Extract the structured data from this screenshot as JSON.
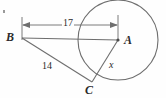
{
  "figure": {
    "type": "circle-tangent-geometry-diagram",
    "background_color": "#fefefe",
    "stroke_color": "#6e6e6e",
    "text_color": "#2b2b2b",
    "width": 166,
    "height": 98
  },
  "points": [
    {
      "name": "B",
      "label": "B",
      "x": 22,
      "y": 38,
      "label_x": 6,
      "label_y": 31
    },
    {
      "name": "A",
      "label": "A",
      "x": 118,
      "y": 40,
      "label_x": 124,
      "label_y": 34
    },
    {
      "name": "C",
      "label": "C",
      "x": 92,
      "y": 82,
      "label_x": 85,
      "label_y": 84
    }
  ],
  "circle": {
    "center_x": 118,
    "center_y": 40,
    "radius": 40,
    "center_dot": true
  },
  "segments": [
    {
      "name": "segment-BA",
      "from": "B",
      "to": "A",
      "label": ""
    },
    {
      "name": "segment-BC",
      "from": "B",
      "to": "C",
      "label": "14"
    },
    {
      "name": "segment-AC-radius",
      "from": "A",
      "to": "C",
      "label": "x"
    }
  ],
  "dimension": {
    "name": "dimension-BA",
    "label": "17",
    "y": 25,
    "x_start": 22,
    "x_end": 118,
    "label_x": 65,
    "label_y": 19,
    "arrows": "both"
  },
  "labels": {
    "B": "B",
    "A": "A",
    "C": "C",
    "length_BA": "17",
    "length_BC": "14",
    "length_AC": "x"
  }
}
